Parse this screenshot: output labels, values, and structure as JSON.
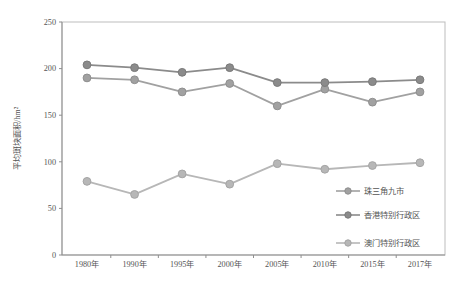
{
  "chart_data": {
    "type": "line",
    "title": "",
    "xlabel": "",
    "ylabel": "平均斑块面积/hm²",
    "ylim": [
      0,
      250
    ],
    "y_ticks": [
      0,
      50,
      100,
      150,
      200,
      250
    ],
    "grid": false,
    "legend_position": "inside-right-middle",
    "categories": [
      "1980年",
      "1990年",
      "1995年",
      "2000年",
      "2005年",
      "2010年",
      "2015年",
      "2017年"
    ],
    "series": [
      {
        "name": "珠三角九市",
        "color": "#a1a1a1",
        "edge": "#8f8f8f",
        "values": [
          190,
          188,
          175,
          184,
          160,
          178,
          164,
          175
        ]
      },
      {
        "name": "香港特别行政区",
        "color": "#8b8b8b",
        "edge": "#7a7a7a",
        "values": [
          204,
          201,
          196,
          201,
          185,
          185,
          186,
          188
        ]
      },
      {
        "name": "澳门特别行政区",
        "color": "#b7b7b7",
        "edge": "#a5a5a5",
        "values": [
          79,
          65,
          87,
          76,
          98,
          92,
          96,
          99
        ]
      }
    ]
  },
  "colors": {
    "background": "#ffffff",
    "plot_border": "#bdbdbd",
    "axis_line": "#8f8f8f",
    "tick_text": "#555555",
    "legend_text": "#555555"
  }
}
